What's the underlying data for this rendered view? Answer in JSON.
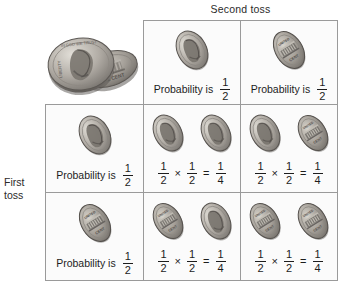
{
  "headings": {
    "column": "Second toss",
    "row_line1": "First",
    "row_line2": "toss"
  },
  "labels": {
    "probability_is": "Probability is",
    "times": "×",
    "equals": "="
  },
  "fractions": {
    "half": {
      "numerator": "1",
      "denominator": "2"
    },
    "quarter": {
      "numerator": "1",
      "denominator": "4"
    }
  },
  "corner": {
    "icon_heads": "penny-heads-icon",
    "icon_tails": "penny-tails-icon"
  },
  "grid": {
    "header_row": [
      {
        "coin": "heads",
        "coin_icon": "penny-heads-icon",
        "caption": "Probability is",
        "probability": {
          "numerator": "1",
          "denominator": "2"
        }
      },
      {
        "coin": "tails",
        "coin_icon": "penny-tails-icon",
        "caption": "Probability is",
        "probability": {
          "numerator": "1",
          "denominator": "2"
        }
      }
    ],
    "header_col": [
      {
        "coin": "heads",
        "coin_icon": "penny-heads-icon",
        "caption": "Probability is",
        "probability": {
          "numerator": "1",
          "denominator": "2"
        }
      },
      {
        "coin": "tails",
        "coin_icon": "penny-tails-icon",
        "caption": "Probability is",
        "probability": {
          "numerator": "1",
          "denominator": "2"
        }
      }
    ],
    "body_cells": [
      {
        "first": "heads",
        "second": "heads",
        "left": {
          "numerator": "1",
          "denominator": "2"
        },
        "op": "×",
        "right": {
          "numerator": "1",
          "denominator": "2"
        },
        "eq": "=",
        "result": {
          "numerator": "1",
          "denominator": "4"
        }
      },
      {
        "first": "heads",
        "second": "tails",
        "left": {
          "numerator": "1",
          "denominator": "2"
        },
        "op": "×",
        "right": {
          "numerator": "1",
          "denominator": "2"
        },
        "eq": "=",
        "result": {
          "numerator": "1",
          "denominator": "4"
        }
      },
      {
        "first": "tails",
        "second": "heads",
        "left": {
          "numerator": "1",
          "denominator": "2"
        },
        "op": "×",
        "right": {
          "numerator": "1",
          "denominator": "2"
        },
        "eq": "=",
        "result": {
          "numerator": "1",
          "denominator": "4"
        }
      },
      {
        "first": "tails",
        "second": "tails",
        "left": {
          "numerator": "1",
          "denominator": "2"
        },
        "op": "×",
        "right": {
          "numerator": "1",
          "denominator": "2"
        },
        "eq": "=",
        "result": {
          "numerator": "1",
          "denominator": "4"
        }
      }
    ]
  },
  "colors": {
    "background": "#ffffff",
    "cell_fill": "#fbfbfb",
    "border": "#9a9a9a",
    "text": "#1d1d1d",
    "coin_light": "#d9d6d0",
    "coin_mid": "#9b9792",
    "coin_dark": "#6a6661"
  }
}
